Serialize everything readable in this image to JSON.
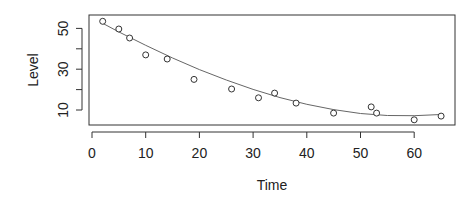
{
  "chart_data": {
    "type": "scatter",
    "title": "",
    "xlabel": "Time",
    "ylabel": "Level",
    "xlim": [
      -0.5,
      67
    ],
    "ylim": [
      3,
      57
    ],
    "xticks": [
      0,
      10,
      20,
      30,
      40,
      50,
      60
    ],
    "yticks": [
      10,
      20,
      30,
      40,
      50
    ],
    "ytick_labels": [
      "10",
      "",
      "30",
      "",
      "50"
    ],
    "grid": false,
    "legend": null,
    "series": [
      {
        "name": "observations",
        "kind": "points",
        "marker": "open-circle",
        "x": [
          2,
          5,
          7,
          10,
          14,
          19,
          26,
          31,
          34,
          38,
          45,
          52,
          53,
          60,
          65
        ],
        "y": [
          53.5,
          49.7,
          45.3,
          37,
          35,
          25,
          20.3,
          16,
          18.3,
          13.4,
          8.5,
          11.5,
          8.5,
          5.2,
          7
        ]
      },
      {
        "name": "fitted curve",
        "kind": "line",
        "x": [
          2,
          5,
          10,
          15,
          20,
          25,
          30,
          35,
          40,
          45,
          50,
          55,
          60,
          65
        ],
        "y": [
          52.5,
          48.3,
          41.7,
          35.5,
          29.8,
          24.7,
          20.1,
          16.1,
          12.8,
          10.2,
          8.3,
          7.3,
          7.2,
          7.8
        ]
      }
    ]
  },
  "colors": {
    "axis": "#333333",
    "points": "#333333",
    "curve": "#666666",
    "background": "#ffffff"
  }
}
